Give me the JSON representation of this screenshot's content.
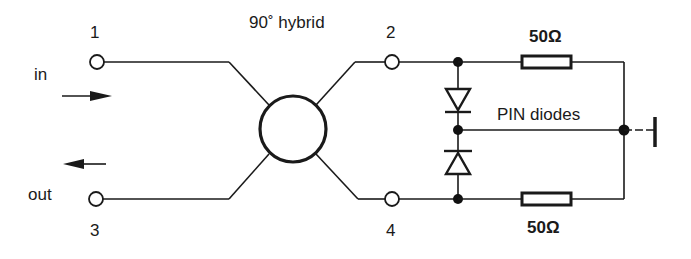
{
  "diagram": {
    "title": "90˚ hybrid",
    "ports": {
      "p1": "1",
      "p2": "2",
      "p3": "3",
      "p4": "4"
    },
    "signals": {
      "input": "in",
      "output": "out"
    },
    "components": {
      "diodes_label": "PIN diodes",
      "resistor_top": "50Ω",
      "resistor_bottom": "50Ω"
    },
    "colors": {
      "ink": "#1a1a1a",
      "background": "#ffffff"
    }
  }
}
